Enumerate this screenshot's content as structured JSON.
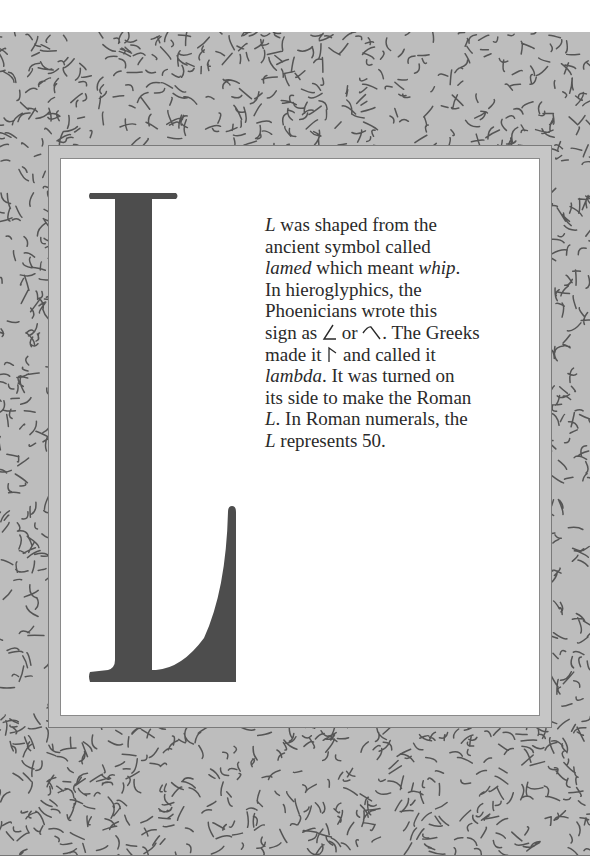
{
  "page": {
    "drop_cap": {
      "letter": "L",
      "color": "#4d4d4d"
    },
    "paragraph": {
      "lines": [
        [
          {
            "t": "L",
            "i": true
          },
          {
            "t": " was shaped from the"
          }
        ],
        [
          {
            "t": "ancient symbol called"
          }
        ],
        [
          {
            "t": "lamed",
            "i": true
          },
          {
            "t": " which meant "
          },
          {
            "t": "whip",
            "i": true
          },
          {
            "t": "."
          }
        ],
        [
          {
            "t": "In hieroglyphics, the"
          }
        ],
        [
          {
            "t": "Phoenicians wrote this"
          }
        ],
        [
          {
            "t": "sign as "
          },
          {
            "sym": "angle-glyph"
          },
          {
            "t": " or "
          },
          {
            "sym": "hook-glyph"
          },
          {
            "t": ". The Greeks"
          }
        ],
        [
          {
            "t": "made it "
          },
          {
            "sym": "gamma-glyph"
          },
          {
            "t": " and called it"
          }
        ],
        [
          {
            "t": "lambda",
            "i": true
          },
          {
            "t": ". It was turned on"
          }
        ],
        [
          {
            "t": "its side to make the Roman"
          }
        ],
        [
          {
            "t": "L",
            "i": true
          },
          {
            "t": ". In Roman numerals, the"
          }
        ],
        [
          {
            "t": "L",
            "i": true
          },
          {
            "t": " represents 50."
          }
        ]
      ]
    },
    "colors": {
      "pattern_bg": "#bdbdbd",
      "squiggle": "#555555",
      "band": "#c6c6c6",
      "panel": "#ffffff",
      "text": "#2a2a2a"
    }
  }
}
